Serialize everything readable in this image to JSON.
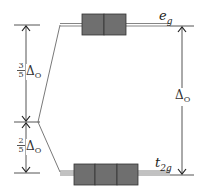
{
  "levels": {
    "eg": {
      "label_main": "e",
      "label_sub": "g",
      "orbitals": 2
    },
    "t2g": {
      "label_main": "t",
      "label_sub": "2g",
      "orbitals": 3
    }
  },
  "splitting": {
    "upper_fraction": {
      "num": "3",
      "den": "5",
      "symbol": "Δ",
      "sub": "O"
    },
    "lower_fraction": {
      "num": "2",
      "den": "5",
      "symbol": "Δ",
      "sub": "O"
    },
    "total": {
      "symbol": "Δ",
      "sub": "O"
    }
  },
  "colors": {
    "box_fill": "#6f6f6f",
    "line": "#444444"
  }
}
